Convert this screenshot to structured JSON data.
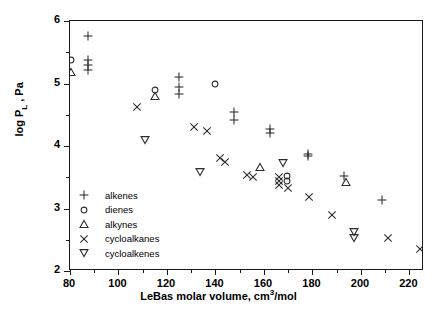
{
  "chart_data": {
    "type": "scatter",
    "title": "",
    "xlabel": "LeBas molar volume, cm3/mol",
    "xlabel_parts": {
      "pre": "LeBas molar volume, cm",
      "sup": "3",
      "post": "/mol"
    },
    "ylabel": "log PL , Pa",
    "ylabel_parts": {
      "pre": "log P",
      "sub": "L",
      "post": " , Pa"
    },
    "xlim": [
      80,
      226
    ],
    "ylim": [
      2,
      6
    ],
    "xticks": [
      80,
      100,
      120,
      140,
      160,
      180,
      200,
      220
    ],
    "xticks_minor": [
      90,
      110,
      130,
      150,
      170,
      190,
      210
    ],
    "yticks": [
      2,
      3,
      4,
      5,
      6
    ],
    "yticks_minor": [
      2.5,
      3.5,
      4.5,
      5.5
    ],
    "grid": false,
    "legend_position": "lower-left-inside",
    "series": [
      {
        "name": "alkenes",
        "marker": "plus",
        "points": [
          [
            87.5,
            5.76
          ],
          [
            87.5,
            5.37
          ],
          [
            87.5,
            5.3
          ],
          [
            87.5,
            5.22
          ],
          [
            125.0,
            5.1
          ],
          [
            125.0,
            4.94
          ],
          [
            125.0,
            4.83
          ],
          [
            147.5,
            4.55
          ],
          [
            147.5,
            4.41
          ],
          [
            162.5,
            4.28
          ],
          [
            162.5,
            4.21
          ],
          [
            178.0,
            3.88
          ],
          [
            178.0,
            3.84
          ],
          [
            193.0,
            3.52
          ],
          [
            208.5,
            3.13
          ]
        ]
      },
      {
        "name": "dienes",
        "marker": "circle",
        "points": [
          [
            80.5,
            5.38
          ],
          [
            115.0,
            4.9
          ],
          [
            140.0,
            5.0
          ],
          [
            169.5,
            3.52
          ],
          [
            169.5,
            3.44
          ]
        ]
      },
      {
        "name": "alkynes",
        "marker": "triangle-up",
        "points": [
          [
            80.5,
            5.18
          ],
          [
            115.0,
            4.8
          ],
          [
            158.5,
            3.66
          ],
          [
            194.0,
            3.43
          ]
        ]
      },
      {
        "name": "cycloalkanes",
        "marker": "cross",
        "points": [
          [
            107.5,
            4.62
          ],
          [
            131.0,
            4.3
          ],
          [
            136.5,
            4.24
          ],
          [
            142.0,
            3.81
          ],
          [
            144.0,
            3.74
          ],
          [
            153.0,
            3.53
          ],
          [
            155.5,
            3.51
          ],
          [
            166.0,
            3.5
          ],
          [
            166.0,
            3.44
          ],
          [
            166.0,
            3.37
          ],
          [
            170.0,
            3.33
          ],
          [
            178.5,
            3.19
          ],
          [
            188.0,
            2.9
          ],
          [
            211.0,
            2.53
          ],
          [
            224.5,
            2.36
          ]
        ]
      },
      {
        "name": "cycloalkenes",
        "marker": "triangle-down",
        "points": [
          [
            111.0,
            4.09
          ],
          [
            133.5,
            3.58
          ],
          [
            168.0,
            3.73
          ],
          [
            197.0,
            2.62
          ],
          [
            197.0,
            2.53
          ]
        ]
      }
    ]
  },
  "legend": {
    "items": [
      {
        "label": "alkenes",
        "marker": "plus"
      },
      {
        "label": "dienes",
        "marker": "circle"
      },
      {
        "label": "alkynes",
        "marker": "triangle-up"
      },
      {
        "label": "cycloalkanes",
        "marker": "cross"
      },
      {
        "label": "cycloalkenes",
        "marker": "triangle-down"
      }
    ]
  }
}
